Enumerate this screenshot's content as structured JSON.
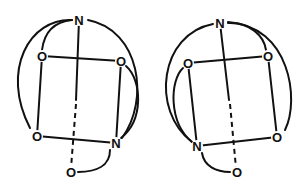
{
  "diagram": {
    "type": "molecular-cage-structures",
    "structures": [
      {
        "name": "left",
        "atoms": [
          {
            "id": "N1",
            "label": "N",
            "x": 79,
            "y": 20
          },
          {
            "id": "O1",
            "label": "O",
            "x": 42,
            "y": 56
          },
          {
            "id": "O2",
            "label": "O",
            "x": 121,
            "y": 61
          },
          {
            "id": "O3",
            "label": "O",
            "x": 37,
            "y": 136
          },
          {
            "id": "N2",
            "label": "N",
            "x": 116,
            "y": 143
          },
          {
            "id": "O4",
            "label": "O",
            "x": 71,
            "y": 172
          }
        ]
      },
      {
        "name": "right",
        "atoms": [
          {
            "id": "N1",
            "label": "N",
            "x": 220,
            "y": 23
          },
          {
            "id": "O1",
            "label": "O",
            "x": 188,
            "y": 63
          },
          {
            "id": "O2",
            "label": "O",
            "x": 268,
            "y": 56
          },
          {
            "id": "N2",
            "label": "N",
            "x": 197,
            "y": 146
          },
          {
            "id": "O3",
            "label": "O",
            "x": 277,
            "y": 137
          },
          {
            "id": "O4",
            "label": "O",
            "x": 237,
            "y": 172
          }
        ]
      }
    ]
  }
}
